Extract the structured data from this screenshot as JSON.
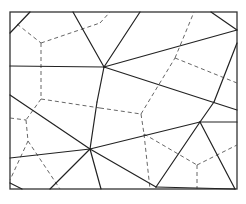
{
  "diagram": {
    "type": "delaunay-voronoi",
    "frame": {
      "x": 10,
      "y": 12,
      "w": 227,
      "h": 177
    },
    "colors": {
      "solid": "#222222",
      "dashed": "#555555",
      "frame": "#333333"
    },
    "delaunay_edges": [
      [
        30,
        12,
        10,
        33
      ],
      [
        10,
        66,
        104,
        67
      ],
      [
        73,
        12,
        104,
        67
      ],
      [
        140,
        12,
        104,
        67
      ],
      [
        104,
        67,
        237,
        30
      ],
      [
        211,
        12,
        237,
        30
      ],
      [
        104,
        67,
        97,
        102
      ],
      [
        104,
        67,
        237,
        110
      ],
      [
        97,
        102,
        90,
        149
      ],
      [
        10,
        95,
        90,
        149
      ],
      [
        10,
        158,
        90,
        149
      ],
      [
        90,
        149,
        200,
        122
      ],
      [
        90,
        149,
        50,
        189
      ],
      [
        90,
        149,
        101,
        189
      ],
      [
        90,
        149,
        156,
        187
      ],
      [
        200,
        122,
        156,
        187
      ],
      [
        200,
        122,
        237,
        122
      ],
      [
        200,
        122,
        235,
        189
      ],
      [
        200,
        122,
        214,
        102
      ],
      [
        214,
        102,
        237,
        43
      ],
      [
        10,
        183,
        22,
        189
      ],
      [
        156,
        187,
        235,
        189
      ]
    ],
    "voronoi_edges": [
      [
        17,
        24,
        41,
        43
      ],
      [
        41,
        43,
        100,
        23
      ],
      [
        100,
        23,
        110,
        12
      ],
      [
        41,
        43,
        41,
        99
      ],
      [
        41,
        99,
        100,
        108
      ],
      [
        41,
        99,
        26,
        120
      ],
      [
        10,
        118,
        26,
        120
      ],
      [
        26,
        120,
        28,
        141
      ],
      [
        28,
        141,
        10,
        180
      ],
      [
        28,
        141,
        60,
        189
      ],
      [
        100,
        108,
        141,
        114
      ],
      [
        141,
        114,
        175,
        58
      ],
      [
        175,
        58,
        194,
        12
      ],
      [
        175,
        58,
        237,
        83
      ],
      [
        141,
        114,
        144,
        134
      ],
      [
        144,
        134,
        150,
        189
      ],
      [
        144,
        134,
        197,
        165
      ],
      [
        197,
        165,
        237,
        145
      ],
      [
        197,
        165,
        197,
        189
      ]
    ]
  }
}
